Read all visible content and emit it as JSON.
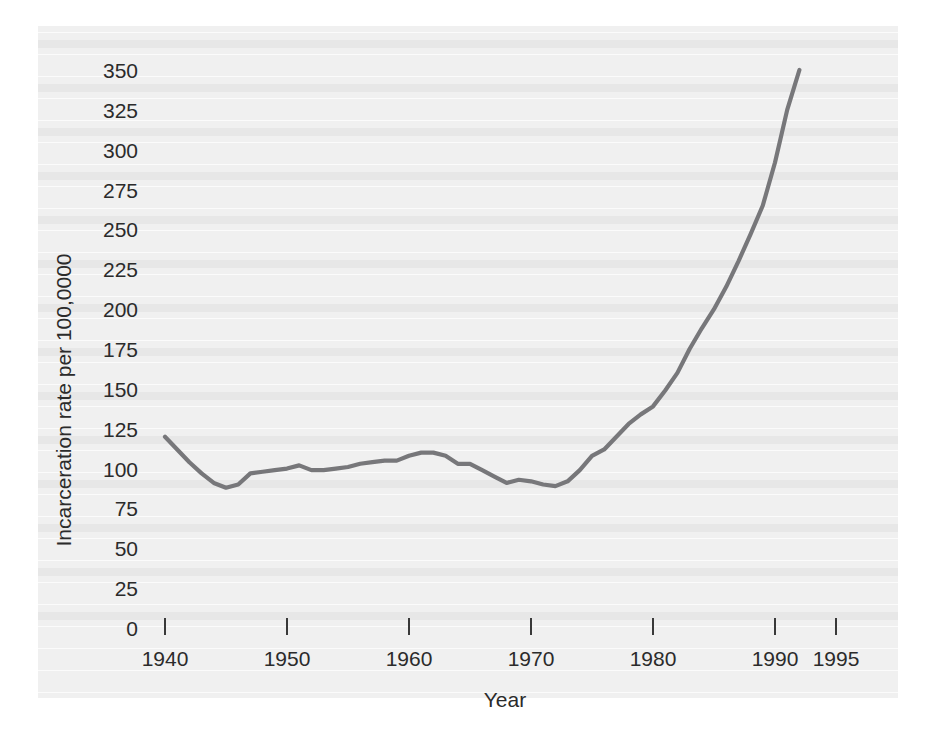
{
  "chart_data": {
    "type": "line",
    "title": "",
    "subtitle": "",
    "xlabel": "Year",
    "ylabel": "Incarceration rate per 100,0000",
    "xlim": [
      1938,
      1996
    ],
    "ylim": [
      0,
      350
    ],
    "grid": false,
    "legend": "none",
    "line_color": "#77777a",
    "x_ticks": [
      1940,
      1950,
      1960,
      1970,
      1980,
      1990,
      1995
    ],
    "x_tick_labels": [
      "1940",
      "1950",
      "1960",
      "1970",
      "1980",
      "1990",
      "1995"
    ],
    "y_ticks": [
      0,
      25,
      50,
      75,
      100,
      125,
      150,
      175,
      200,
      225,
      250,
      275,
      300,
      325,
      350
    ],
    "y_tick_labels": [
      "0",
      "25",
      "50",
      "75",
      "100",
      "125",
      "150",
      "175",
      "200",
      "225",
      "250",
      "275",
      "300",
      "325",
      "350"
    ],
    "series": [
      {
        "name": "Incarceration rate",
        "x": [
          1940,
          1941,
          1942,
          1943,
          1944,
          1945,
          1946,
          1947,
          1948,
          1949,
          1950,
          1951,
          1952,
          1953,
          1954,
          1955,
          1956,
          1957,
          1958,
          1959,
          1960,
          1961,
          1962,
          1963,
          1964,
          1965,
          1966,
          1967,
          1968,
          1969,
          1970,
          1971,
          1972,
          1973,
          1974,
          1975,
          1976,
          1977,
          1978,
          1979,
          1980,
          1981,
          1982,
          1983,
          1984,
          1985,
          1986,
          1987,
          1988,
          1989,
          1990,
          1991,
          1992
        ],
        "values": [
          120,
          112,
          104,
          97,
          91,
          88,
          90,
          97,
          98,
          99,
          100,
          102,
          99,
          99,
          100,
          101,
          103,
          104,
          105,
          105,
          108,
          110,
          110,
          108,
          103,
          103,
          99,
          95,
          91,
          93,
          92,
          90,
          89,
          92,
          99,
          108,
          112,
          120,
          128,
          134,
          139,
          149,
          160,
          175,
          188,
          200,
          214,
          230,
          247,
          265,
          292,
          325,
          350
        ]
      }
    ],
    "annotations": []
  },
  "axis": {
    "y_axis_title": "Incarceration rate per 100,0000",
    "x_axis_title": "Year"
  },
  "colors": {
    "line": "#77777a",
    "text": "#2b2b2b",
    "paper": "#f0f0f0",
    "page": "#ffffff"
  }
}
